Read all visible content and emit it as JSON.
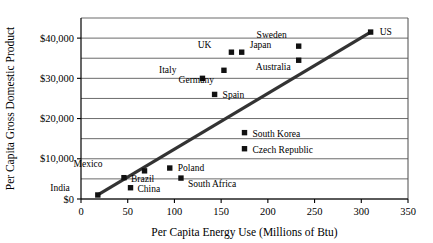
{
  "chart_data": {
    "type": "scatter",
    "title": "",
    "xlabel": "Per Capita Energy Use (Millions of Btu)",
    "ylabel": "Per Capita Gross Domestic Product",
    "xlim": [
      0,
      350
    ],
    "ylim": [
      0,
      45000
    ],
    "xticks": [
      0,
      50,
      100,
      150,
      200,
      250,
      300,
      350
    ],
    "xtick_labels": [
      "0",
      "50",
      "100",
      "150",
      "200",
      "250",
      "300",
      "350"
    ],
    "yticks": [
      0,
      10000,
      20000,
      30000,
      40000
    ],
    "ytick_labels": [
      "$0",
      "$10,000",
      "$20,000",
      "$30,000",
      "$40,000"
    ],
    "gridlines_y": [
      0,
      5000,
      10000,
      15000,
      20000,
      25000,
      30000,
      35000,
      40000,
      45000
    ],
    "grid": true,
    "legend": "none",
    "marker_shape": "square",
    "points": [
      {
        "label": "India",
        "x": 18,
        "y": 1000,
        "label_dx": -28,
        "label_dy": -4
      },
      {
        "label": "China",
        "x": 53,
        "y": 2800,
        "label_dx": 7,
        "label_dy": 4
      },
      {
        "label": "Brazil",
        "x": 46,
        "y": 5300,
        "label_dx": 7,
        "label_dy": 4
      },
      {
        "label": "South Africa",
        "x": 107,
        "y": 5200,
        "label_dx": 7,
        "label_dy": 9
      },
      {
        "label": "Mexico",
        "x": 68,
        "y": 7000,
        "label_dx": -42,
        "label_dy": -4
      },
      {
        "label": "Poland",
        "x": 95,
        "y": 7700,
        "label_dx": 8,
        "label_dy": 3
      },
      {
        "label": "Czech Republic",
        "x": 175,
        "y": 12500,
        "label_dx": 8,
        "label_dy": 4
      },
      {
        "label": "South Korea",
        "x": 175,
        "y": 16500,
        "label_dx": 8,
        "label_dy": 4
      },
      {
        "label": "Spain",
        "x": 143,
        "y": 26000,
        "label_dx": 8,
        "label_dy": 4
      },
      {
        "label": "Italy",
        "x": 130,
        "y": 30000,
        "label_dx": -26,
        "label_dy": -5
      },
      {
        "label": "Germany",
        "x": 153,
        "y": 32000,
        "label_dx": -10,
        "label_dy": 13
      },
      {
        "label": "Australia",
        "x": 233,
        "y": 34500,
        "label_dx": -8,
        "label_dy": 10
      },
      {
        "label": "UK",
        "x": 161,
        "y": 36500,
        "label_dx": -20,
        "label_dy": -4
      },
      {
        "label": "Japan",
        "x": 172,
        "y": 36500,
        "label_dx": 8,
        "label_dy": -4
      },
      {
        "label": "Sweden",
        "x": 233,
        "y": 38000,
        "label_dx": -12,
        "label_dy": -8
      },
      {
        "label": "US",
        "x": 310,
        "y": 41500,
        "label_dx": 9,
        "label_dy": 3
      }
    ],
    "trend_line": {
      "x1": 18,
      "y1": 1000,
      "x2": 310,
      "y2": 41500
    }
  }
}
